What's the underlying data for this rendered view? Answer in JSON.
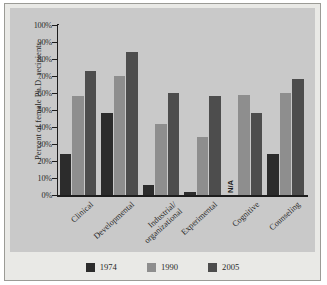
{
  "chart_data": {
    "type": "bar",
    "title": "",
    "xlabel": "",
    "ylabel": "Percent of female Ph.D. recipients",
    "ylim": [
      0,
      100
    ],
    "ytick_labels": [
      "100%",
      "90%",
      "80%",
      "70%",
      "60%",
      "50%",
      "40%",
      "30%",
      "20%",
      "10%",
      "0%"
    ],
    "ytick_values": [
      100,
      90,
      80,
      70,
      60,
      50,
      40,
      30,
      20,
      10,
      0
    ],
    "grid": true,
    "legend_position": "bottom",
    "categories": [
      "Clinical",
      "Developmental",
      "Industrial/organizational",
      "Experimental",
      "Cognitive",
      "Counseling"
    ],
    "category_lines": [
      [
        "Clinical"
      ],
      [
        "Developmental"
      ],
      [
        "Industrial/",
        "organizational"
      ],
      [
        "Experimental"
      ],
      [
        "Cognitive"
      ],
      [
        "Counseling"
      ]
    ],
    "series": [
      {
        "name": "1974",
        "color": "#2c2c2c",
        "values": [
          24,
          48,
          6,
          2,
          null,
          24
        ],
        "missing_label": "N/A"
      },
      {
        "name": "1990",
        "color": "#8e8e8e",
        "values": [
          58,
          70,
          42,
          34,
          59,
          60
        ]
      },
      {
        "name": "2005",
        "color": "#4d4d4d",
        "values": [
          73,
          84,
          60,
          58,
          48.5,
          68
        ]
      }
    ]
  },
  "legend": {
    "items": [
      {
        "label": "1974",
        "color": "#2c2c2c"
      },
      {
        "label": "1990",
        "color": "#8e8e8e"
      },
      {
        "label": "2005",
        "color": "#4d4d4d"
      }
    ]
  },
  "colors": {
    "panel_background": "#c9c9c9",
    "figure_background": "#e9e9e6",
    "gridline": "#f2f2f2",
    "axis": "#1d1d1d",
    "text": "#2a2a2a"
  }
}
